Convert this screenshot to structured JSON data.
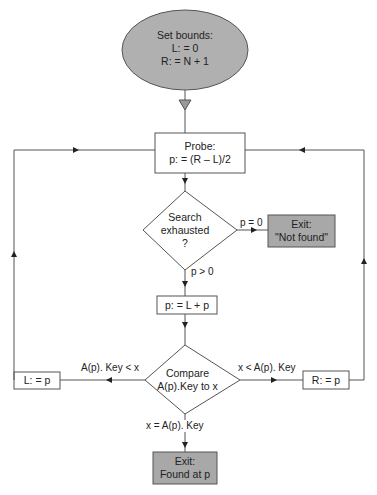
{
  "diagram": {
    "type": "flowchart",
    "colors": {
      "terminal_fill": "#a8a8a8",
      "start_fill": "#b0b0b0",
      "process_fill": "#ffffff",
      "line": "#555555",
      "text": "#222222"
    },
    "nodes": {
      "start": {
        "shape": "ellipse",
        "line1": "Set bounds:",
        "line2": "L: = 0",
        "line3": "R: = N + 1"
      },
      "probe": {
        "shape": "rect",
        "line1": "Probe:",
        "line2": "p: = (R – L)/2"
      },
      "exhausted": {
        "shape": "diamond",
        "line1": "Search",
        "line2": "exhausted",
        "line3": "?"
      },
      "not_found": {
        "shape": "rect-terminal",
        "line1": "Exit:",
        "line2": "\"Not found\""
      },
      "advance": {
        "shape": "rect",
        "line1": "p: = L + p"
      },
      "compare": {
        "shape": "diamond",
        "line1": "Compare",
        "line2": "A(p).Key to x"
      },
      "set_left": {
        "shape": "rect",
        "line1": "L: = p"
      },
      "set_right": {
        "shape": "rect",
        "line1": "R: = p"
      },
      "found": {
        "shape": "rect-terminal",
        "line1": "Exit:",
        "line2": "Found at p"
      }
    },
    "edges": {
      "exhausted_yes": "p = 0",
      "exhausted_no": "p > 0",
      "compare_less": "A(p). Key < x",
      "compare_greater": "x < A(p). Key",
      "compare_equal": "x = A(p). Key"
    }
  }
}
